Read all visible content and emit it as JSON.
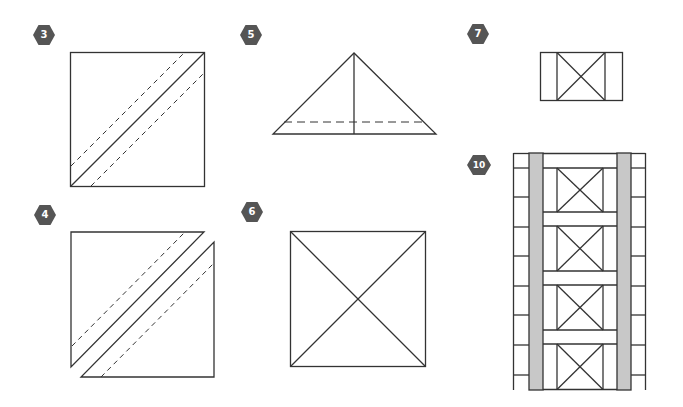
{
  "colors": {
    "line": "#333333",
    "badge_fill": "#555555",
    "badge_text": "#ffffff",
    "strip_fill": "#c8c8c8",
    "background": "#ffffff"
  },
  "steps": [
    {
      "number": "3",
      "description": "Square with solid diagonal and two dashed seam lines"
    },
    {
      "number": "4",
      "description": "Square cut along diagonal into two triangles, each with a dashed seam line"
    },
    {
      "number": "5",
      "description": "Triangle with vertical center line and dashed horizontal line near base"
    },
    {
      "number": "6",
      "description": "Square with both diagonals (hourglass block)"
    },
    {
      "number": "7",
      "description": "Hourglass block with side strips"
    },
    {
      "number": "10",
      "description": "Column of four hourglass blocks with sashing, gray strips and pieced side borders"
    }
  ]
}
